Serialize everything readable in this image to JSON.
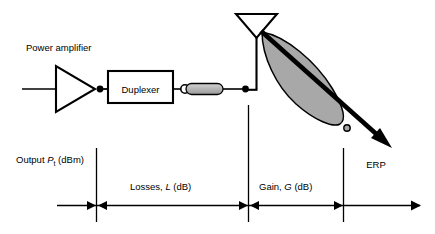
{
  "diagram": {
    "labels": {
      "power_amplifier": "Power amplifier",
      "duplexer": "Duplexer",
      "erp": "ERP",
      "output_prefix": "Output ",
      "output_symbol": "P",
      "output_subscript": "t",
      "output_unit": " (dBm)",
      "losses_prefix": "Losses, ",
      "losses_symbol": "L",
      "losses_unit": " (dB)",
      "gain_prefix": "Gain, ",
      "gain_symbol": "G",
      "gain_unit": " (dB)"
    },
    "components": [
      {
        "name": "power-amplifier",
        "shape": "triangle"
      },
      {
        "name": "duplexer",
        "shape": "rectangle"
      },
      {
        "name": "feeder-cable",
        "shape": "rounded-bar"
      },
      {
        "name": "antenna",
        "shape": "horn"
      },
      {
        "name": "radiation-lobe",
        "shape": "teardrop"
      },
      {
        "name": "erp-arrow",
        "shape": "thick-arrow"
      }
    ],
    "segments": [
      {
        "name": "output-power",
        "label": "Output Pt (dBm)"
      },
      {
        "name": "losses",
        "label": "Losses, L (dB)"
      },
      {
        "name": "gain",
        "label": "Gain, G (dB)"
      },
      {
        "name": "erp-result",
        "label": "ERP"
      }
    ],
    "colors": {
      "stroke": "#000000",
      "background": "#ffffff",
      "lobe_fill": "#a8a8a8",
      "cable_fill": "#b4b4b4"
    }
  }
}
